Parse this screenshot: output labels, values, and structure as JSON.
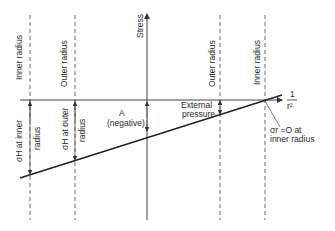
{
  "diagram": {
    "axes": {
      "y_label": "Stress",
      "x_label_num": "1",
      "x_label_den": "r²"
    },
    "verticals": [
      {
        "label": "Inner radius",
        "side": "left"
      },
      {
        "label": "Outer radius",
        "side": "left"
      },
      {
        "label": "Outer radius",
        "side": "right"
      },
      {
        "label": "Inner radius",
        "side": "right"
      }
    ],
    "annotations": {
      "sigma_inner_1": "σH at inner",
      "sigma_inner_2": "radius",
      "sigma_outer_1": "σH at outer",
      "sigma_outer_2": "radius",
      "a_label": "A",
      "a_note": "(negative)",
      "ext_1": "External",
      "ext_2": "pressure",
      "sr_1": "σr =O at",
      "sr_2": "inner radius"
    }
  }
}
